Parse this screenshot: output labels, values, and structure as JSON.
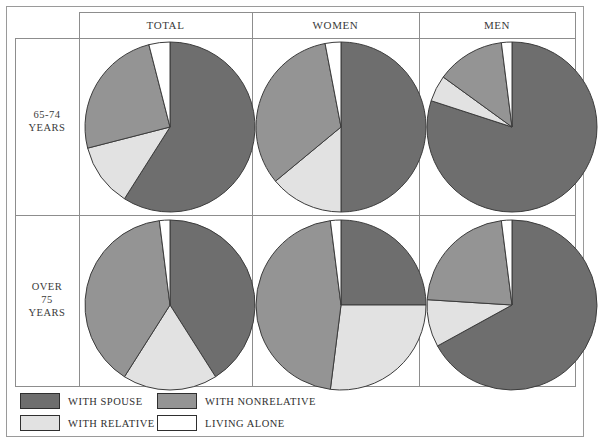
{
  "figure": {
    "title": "",
    "columns": [
      {
        "id": "total",
        "label": "TOTAL"
      },
      {
        "id": "women",
        "label": "WOMEN"
      },
      {
        "id": "men",
        "label": "MEN"
      }
    ],
    "rows": [
      {
        "id": "age-65-74",
        "lines": [
          "65-74",
          "YEARS"
        ]
      },
      {
        "id": "age-over-75",
        "lines": [
          "OVER",
          "75",
          "YEARS"
        ]
      }
    ]
  },
  "legend": {
    "position": "bottom-left",
    "items": [
      {
        "id": "with-spouse",
        "label": "WITH SPOUSE",
        "color": "#6e6e6e"
      },
      {
        "id": "with-relative",
        "label": "WITH RELATIVE",
        "color": "#e2e2e2"
      },
      {
        "id": "with-nonrelative",
        "label": "WITH NONRELATIVE",
        "color": "#949494"
      },
      {
        "id": "living-alone",
        "label": "LIVING ALONE",
        "color": "#ffffff"
      }
    ]
  },
  "colors": {
    "with_spouse": "#6e6e6e",
    "with_relative": "#e2e2e2",
    "with_nonrelative": "#949494",
    "living_alone": "#ffffff",
    "slice_outline": "#3c3c3c",
    "grid": "#8d8d8d",
    "frame": "#9a9a9a"
  },
  "chart_data": {
    "type": "pie",
    "legend_position": "bottom-left",
    "categories": [
      "WITH SPOUSE",
      "WITH RELATIVE",
      "WITH NONRELATIVE",
      "LIVING ALONE"
    ],
    "category_colors": [
      "#6e6e6e",
      "#e2e2e2",
      "#949494",
      "#ffffff"
    ],
    "row_labels": [
      "65-74 YEARS",
      "OVER 75 YEARS"
    ],
    "column_labels": [
      "TOTAL",
      "WOMEN",
      "MEN"
    ],
    "units": "percent",
    "charts": [
      {
        "id": "total-65-74",
        "row": "65-74 YEARS",
        "column": "TOTAL",
        "start_angle_deg": 0,
        "direction": "clockwise",
        "labels": [
          "WITH SPOUSE",
          "WITH RELATIVE",
          "WITH NONRELATIVE",
          "LIVING ALONE"
        ],
        "values": [
          59,
          12,
          25,
          4
        ]
      },
      {
        "id": "women-65-74",
        "row": "65-74 YEARS",
        "column": "WOMEN",
        "start_angle_deg": 0,
        "direction": "clockwise",
        "labels": [
          "WITH SPOUSE",
          "WITH RELATIVE",
          "WITH NONRELATIVE",
          "LIVING ALONE"
        ],
        "values": [
          50,
          14,
          33,
          3
        ]
      },
      {
        "id": "men-65-74",
        "row": "65-74 YEARS",
        "column": "MEN",
        "start_angle_deg": 0,
        "direction": "clockwise",
        "labels": [
          "WITH SPOUSE",
          "WITH RELATIVE",
          "WITH NONRELATIVE",
          "LIVING ALONE"
        ],
        "values": [
          80,
          5,
          13,
          2
        ]
      },
      {
        "id": "total-over-75",
        "row": "OVER 75 YEARS",
        "column": "TOTAL",
        "start_angle_deg": 0,
        "direction": "clockwise",
        "labels": [
          "WITH SPOUSE",
          "WITH RELATIVE",
          "WITH NONRELATIVE",
          "LIVING ALONE"
        ],
        "values": [
          41,
          18,
          39,
          2
        ]
      },
      {
        "id": "women-over-75",
        "row": "OVER 75 YEARS",
        "column": "WOMEN",
        "start_angle_deg": 0,
        "direction": "clockwise",
        "labels": [
          "WITH SPOUSE",
          "WITH RELATIVE",
          "WITH NONRELATIVE",
          "LIVING ALONE"
        ],
        "values": [
          25,
          27,
          46,
          2
        ]
      },
      {
        "id": "men-over-75",
        "row": "OVER 75 YEARS",
        "column": "MEN",
        "start_angle_deg": 0,
        "direction": "clockwise",
        "labels": [
          "WITH SPOUSE",
          "WITH RELATIVE",
          "WITH NONRELATIVE",
          "LIVING ALONE"
        ],
        "values": [
          67,
          9,
          22,
          2
        ]
      }
    ]
  },
  "layout": {
    "pie_radius": 85,
    "column_x": [
      72,
      245,
      412,
      561
    ],
    "header_height": 26,
    "row_divider_y": 203
  }
}
